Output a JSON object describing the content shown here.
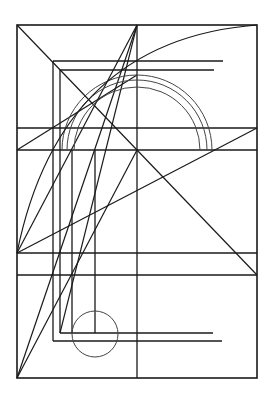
{
  "diagram": {
    "title": "",
    "background": "#ffffff",
    "stroke_color": "#1a1a1a",
    "thin_stroke_color": "#444444",
    "width": 274,
    "height": 407,
    "outer_rect": {
      "x": 17,
      "y": 25,
      "w": 240,
      "h": 353
    },
    "verticals": [
      {
        "x": 137,
        "y1": 25,
        "y2": 378
      },
      {
        "x": 53,
        "y1": 61,
        "y2": 341
      },
      {
        "x": 60,
        "y1": 70,
        "y2": 333
      },
      {
        "x": 72,
        "y1": 150,
        "y2": 333
      },
      {
        "x": 95,
        "y1": 150,
        "y2": 333
      }
    ],
    "horizontals": [
      {
        "y": 61,
        "x1": 53,
        "x2": 223
      },
      {
        "y": 70,
        "x1": 60,
        "x2": 214
      },
      {
        "y": 128,
        "x1": 17,
        "x2": 257
      },
      {
        "y": 150,
        "x1": 17,
        "x2": 257
      },
      {
        "y": 253,
        "x1": 17,
        "x2": 257
      },
      {
        "y": 275,
        "x1": 17,
        "x2": 257
      },
      {
        "y": 333,
        "x1": 60,
        "x2": 213
      },
      {
        "y": 341,
        "x1": 53,
        "x2": 222
      }
    ],
    "diagonals": [
      {
        "x1": 17,
        "y1": 25,
        "x2": 257,
        "y2": 275
      },
      {
        "x1": 257,
        "y1": 128,
        "x2": 17,
        "y2": 253
      },
      {
        "x1": 17,
        "y1": 378,
        "x2": 137,
        "y2": 25
      },
      {
        "x1": 17,
        "y1": 378,
        "x2": 137,
        "y2": 150
      },
      {
        "x1": 17,
        "y1": 253,
        "x2": 137,
        "y2": 25
      },
      {
        "x1": 60,
        "y1": 333,
        "x2": 137,
        "y2": 25
      },
      {
        "x1": 17,
        "y1": 150,
        "x2": 137,
        "y2": 75
      }
    ],
    "arcs": [
      {
        "cx": 137,
        "cy": 150,
        "r": 63
      },
      {
        "cx": 137,
        "cy": 150,
        "r": 70
      },
      {
        "cx": 137,
        "cy": 150,
        "r": 75
      }
    ],
    "large_arc": {
      "from": [
        17,
        253
      ],
      "to": [
        257,
        25
      ]
    },
    "circle": {
      "cx": 95,
      "cy": 334,
      "r": 23
    }
  }
}
